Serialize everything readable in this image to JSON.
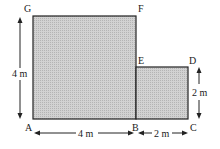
{
  "diagram": {
    "type": "composite-rectangle-figure",
    "vertices": {
      "A": "A",
      "B": "B",
      "C": "C",
      "D": "D",
      "E": "E",
      "F": "F",
      "G": "G"
    },
    "dimensions": {
      "height_ag": "4 m",
      "width_ab": "4 m",
      "width_bc": "2 m",
      "height_cd": "2 m"
    },
    "colors": {
      "fill": "#c8c8c8",
      "stroke": "#222222",
      "text": "#1a1a1a"
    }
  }
}
